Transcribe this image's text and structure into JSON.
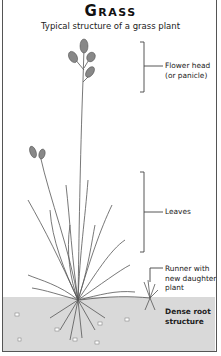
{
  "title": "Grass",
  "subtitle": "Typical structure of a grass plant",
  "labels": {
    "flower_head": "Flower head",
    "flower_head_alt": "(or panicle)",
    "leaves": "Leaves",
    "runner_1": "Runner with",
    "runner_2": "new daughter",
    "runner_3": "plant",
    "roots_1": "Dense root",
    "roots_2": "structure"
  },
  "colors": {
    "soil": "#d9d9d9",
    "line": "#444444",
    "text": "#222222"
  }
}
